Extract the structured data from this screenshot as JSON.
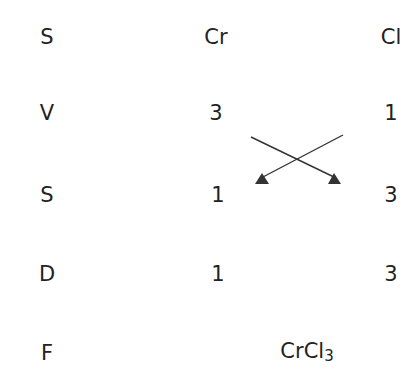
{
  "rows": [
    {
      "label": "S",
      "cr": "Cr",
      "cl": "Cl"
    },
    {
      "label": "V",
      "cr": "3",
      "cl": "1"
    },
    {
      "label": "S",
      "cr": "1",
      "cl": "3"
    },
    {
      "label": "D",
      "cr": "1",
      "cl": "3"
    }
  ],
  "final": {
    "label": "F",
    "formula_main": "CrCl",
    "formula_sub": "3"
  },
  "colors": {
    "text": "#222222",
    "arrow": "#333333"
  }
}
